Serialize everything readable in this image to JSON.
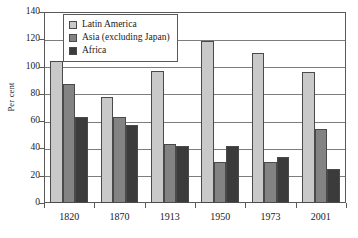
{
  "chart_data": {
    "type": "bar",
    "title": "",
    "subtitle": "",
    "xlabel": "",
    "ylabel": "Per cent",
    "categories": [
      "1820",
      "1870",
      "1913",
      "1950",
      "1973",
      "2001"
    ],
    "series": [
      {
        "name": "Latin America",
        "color": "#c9c9c9",
        "values": [
          104,
          78,
          97,
          119,
          110,
          96
        ]
      },
      {
        "name": "Asia (excluding Japan)",
        "color": "#838383",
        "values": [
          87,
          63,
          43,
          30,
          30,
          54
        ]
      },
      {
        "name": "Africa",
        "color": "#3b3b3b",
        "values": [
          63,
          57,
          42,
          42,
          34,
          25
        ]
      }
    ],
    "ylim": [
      0,
      140
    ],
    "yticks": [
      0,
      20,
      40,
      60,
      80,
      100,
      120,
      140
    ],
    "ytick_labels": [
      "0",
      "20",
      "40",
      "60",
      "80",
      "100",
      "120",
      "140"
    ],
    "grid": true,
    "grid_axis": "y",
    "legend_position": "top-left-inside",
    "legend": [
      {
        "label": "Latin America",
        "color": "#c9c9c9"
      },
      {
        "label": "Asia (excluding Japan)",
        "color": "#838383"
      },
      {
        "label": "Africa",
        "color": "#3b3b3b"
      }
    ],
    "colors": {
      "latin_america": "#c9c9c9",
      "asia_excluding_japan": "#838383",
      "africa": "#3b3b3b",
      "axis": "#5a5a5a",
      "gridline": "#7d7d7d",
      "background": "#ffffff",
      "text": "#1a1a1a"
    }
  }
}
